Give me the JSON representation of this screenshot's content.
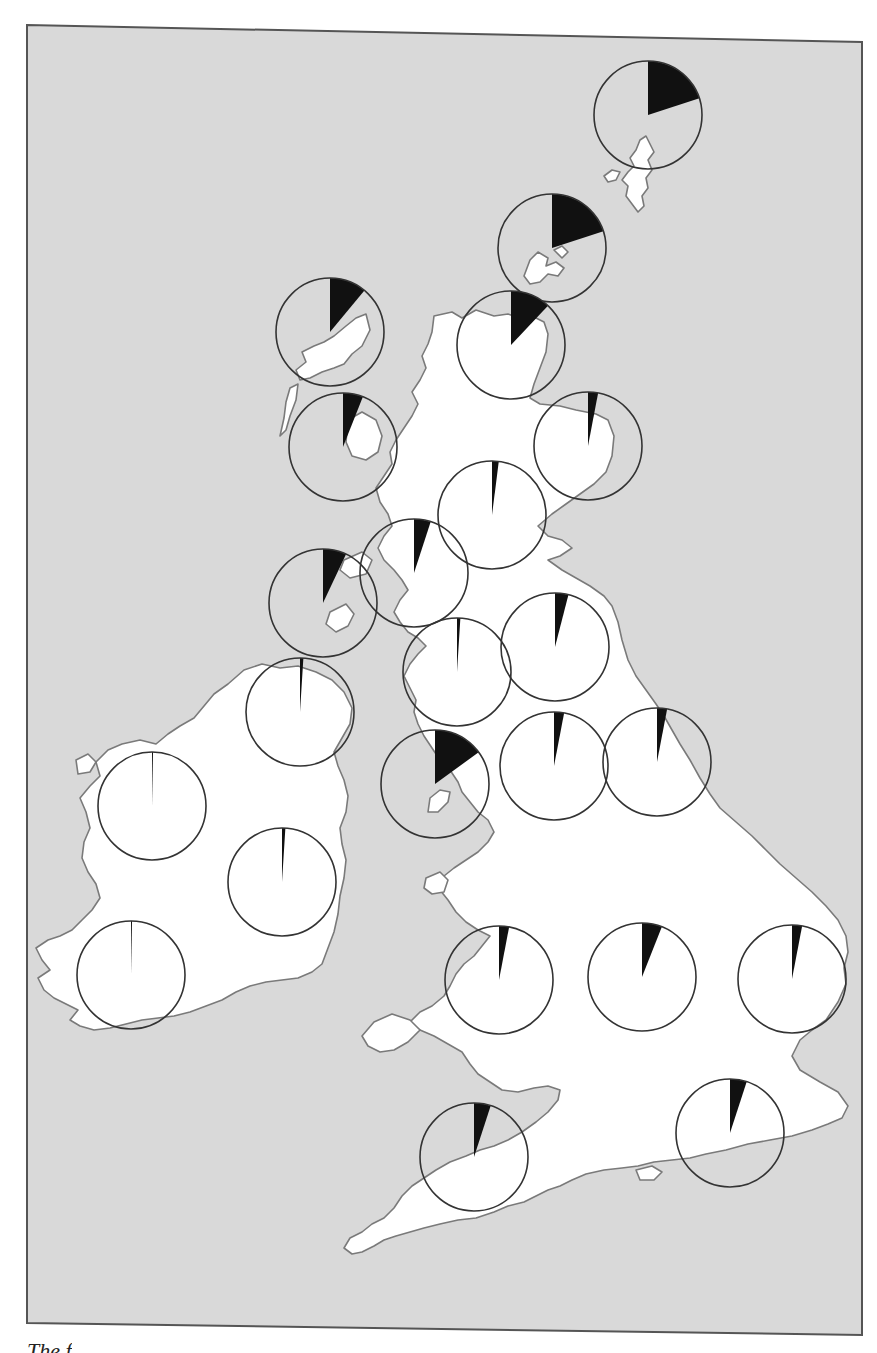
{
  "figure": {
    "caption_fragment": "The f",
    "colors": {
      "sea": "#d9d9d9",
      "land": "#ffffff",
      "coastline": "#7a7a7a",
      "pie_outline": "#333333",
      "wedge": "#111111",
      "frame": "#555555"
    }
  },
  "chart_data": {
    "type": "pie",
    "title": "",
    "legend": [],
    "series": [
      {
        "name": "Shetland",
        "value": 20
      },
      {
        "name": "Orkney",
        "value": 20
      },
      {
        "name": "Lewis / Outer Hebrides",
        "value": 11
      },
      {
        "name": "Caithness & Sutherland",
        "value": 12
      },
      {
        "name": "Skye / Western Isles",
        "value": 6
      },
      {
        "name": "North-east Scotland",
        "value": 3
      },
      {
        "name": "Central Highlands",
        "value": 2
      },
      {
        "name": "Argyll",
        "value": 5
      },
      {
        "name": "Islay / Kintyre",
        "value": 7
      },
      {
        "name": "Galloway / South-west Scotland",
        "value": 1
      },
      {
        "name": "Scottish Borders / Lothian",
        "value": 4
      },
      {
        "name": "Northern Ireland",
        "value": 1
      },
      {
        "name": "Isle of Man",
        "value": 15
      },
      {
        "name": "Cumbria / North-west England",
        "value": 3
      },
      {
        "name": "North-east England",
        "value": 3
      },
      {
        "name": "West of Ireland",
        "value": 0.3
      },
      {
        "name": "East of Ireland",
        "value": 1
      },
      {
        "name": "South-west Ireland",
        "value": 0.3
      },
      {
        "name": "Wales",
        "value": 3
      },
      {
        "name": "Midlands",
        "value": 6
      },
      {
        "name": "East Anglia",
        "value": 3
      },
      {
        "name": "South-west England",
        "value": 5
      },
      {
        "name": "South-east England",
        "value": 5
      }
    ]
  }
}
